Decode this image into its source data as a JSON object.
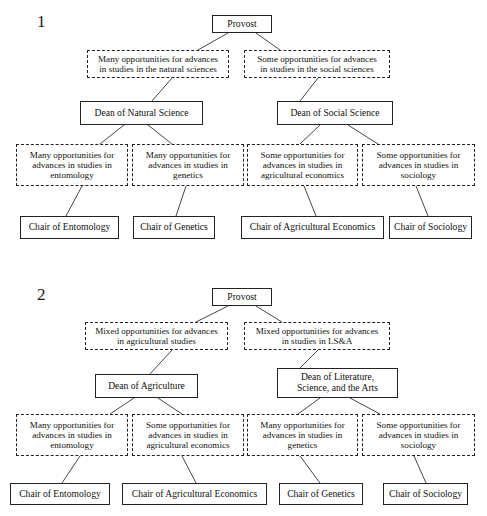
{
  "page": {
    "width": 487,
    "height": 516,
    "background": "#ffffff",
    "ink": "#1a1a1a"
  },
  "figures": [
    {
      "number": "1",
      "number_pos": {
        "x": 37,
        "y": 12
      },
      "nodes": [
        {
          "id": "f1-provost",
          "name": "node-provost",
          "style": "solid",
          "label": "Provost",
          "x": 212,
          "y": 15,
          "w": 60,
          "h": 18
        },
        {
          "id": "f1-opp-natural",
          "name": "node-opportunity-natural-sciences",
          "style": "dashed",
          "label": "Many opportunities for advances\nin studies in the natural sciences",
          "x": 87,
          "y": 50,
          "w": 142,
          "h": 28
        },
        {
          "id": "f1-opp-social",
          "name": "node-opportunity-social-sciences",
          "style": "dashed",
          "label": "Some opportunities for advances\nin studies in the social sciences",
          "x": 244,
          "y": 50,
          "w": 146,
          "h": 28
        },
        {
          "id": "f1-dean-natural",
          "name": "node-dean-natural-science",
          "style": "solid",
          "label": "Dean of Natural Science",
          "x": 80,
          "y": 101,
          "w": 123,
          "h": 24
        },
        {
          "id": "f1-dean-social",
          "name": "node-dean-social-science",
          "style": "solid",
          "label": "Dean of Social Science",
          "x": 277,
          "y": 101,
          "w": 116,
          "h": 24
        },
        {
          "id": "f1-opp-entomology",
          "name": "node-opportunity-entomology",
          "style": "dashed",
          "label": "Many opportunities for\nadvances in studies in\nentomology",
          "x": 16,
          "y": 144,
          "w": 112,
          "h": 42
        },
        {
          "id": "f1-opp-genetics",
          "name": "node-opportunity-genetics",
          "style": "dashed",
          "label": "Many opportunities for\nadvances in studies in\ngenetics",
          "x": 132,
          "y": 144,
          "w": 112,
          "h": 42
        },
        {
          "id": "f1-opp-agecon",
          "name": "node-opportunity-agricultural-economics",
          "style": "dashed",
          "label": "Some opportunities for\nadvances in studies in\nagricultural economics",
          "x": 247,
          "y": 144,
          "w": 111,
          "h": 42
        },
        {
          "id": "f1-opp-sociology",
          "name": "node-opportunity-sociology",
          "style": "dashed",
          "label": "Some opportunities for\nadvances in studies in\nsociology",
          "x": 362,
          "y": 144,
          "w": 113,
          "h": 42
        },
        {
          "id": "f1-chair-entomology",
          "name": "node-chair-entomology",
          "style": "solid",
          "label": "Chair of Entomology",
          "x": 20,
          "y": 216,
          "w": 99,
          "h": 23
        },
        {
          "id": "f1-chair-genetics",
          "name": "node-chair-genetics",
          "style": "solid",
          "label": "Chair of Genetics",
          "x": 133,
          "y": 216,
          "w": 82,
          "h": 23
        },
        {
          "id": "f1-chair-agecon",
          "name": "node-chair-agricultural-economics",
          "style": "solid",
          "label": "Chair of Agricultural Economics",
          "x": 241,
          "y": 216,
          "w": 143,
          "h": 23
        },
        {
          "id": "f1-chair-sociology",
          "name": "node-chair-sociology",
          "style": "solid",
          "label": "Chair of Sociology",
          "x": 389,
          "y": 216,
          "w": 83,
          "h": 23
        }
      ],
      "links": [
        {
          "x1": 228,
          "y1": 33,
          "x2": 198,
          "y2": 50
        },
        {
          "x1": 256,
          "y1": 33,
          "x2": 280,
          "y2": 50
        },
        {
          "x1": 172,
          "y1": 78,
          "x2": 152,
          "y2": 101
        },
        {
          "x1": 318,
          "y1": 78,
          "x2": 300,
          "y2": 101
        },
        {
          "x1": 124,
          "y1": 125,
          "x2": 100,
          "y2": 144
        },
        {
          "x1": 148,
          "y1": 125,
          "x2": 172,
          "y2": 144
        },
        {
          "x1": 320,
          "y1": 125,
          "x2": 300,
          "y2": 144
        },
        {
          "x1": 348,
          "y1": 125,
          "x2": 378,
          "y2": 144
        },
        {
          "x1": 82,
          "y1": 186,
          "x2": 66,
          "y2": 216
        },
        {
          "x1": 186,
          "y1": 186,
          "x2": 176,
          "y2": 216
        },
        {
          "x1": 304,
          "y1": 186,
          "x2": 316,
          "y2": 216
        },
        {
          "x1": 416,
          "y1": 186,
          "x2": 428,
          "y2": 216
        }
      ]
    },
    {
      "number": "2",
      "number_pos": {
        "x": 37,
        "y": 285
      },
      "nodes": [
        {
          "id": "f2-provost",
          "name": "node-provost",
          "style": "solid",
          "label": "Provost",
          "x": 212,
          "y": 288,
          "w": 60,
          "h": 18
        },
        {
          "id": "f2-opp-ag",
          "name": "node-opportunity-agricultural-studies",
          "style": "dashed",
          "label": "Mixed opportunities for advances\nin agricultural studies",
          "x": 85,
          "y": 322,
          "w": 143,
          "h": 28
        },
        {
          "id": "f2-opp-lsa",
          "name": "node-opportunity-lsa",
          "style": "dashed",
          "label": "Mixed opportunities for advances\nin studies in LS&A",
          "x": 244,
          "y": 322,
          "w": 146,
          "h": 28
        },
        {
          "id": "f2-dean-ag",
          "name": "node-dean-agriculture",
          "style": "solid",
          "label": "Dean of Agriculture",
          "x": 95,
          "y": 374,
          "w": 103,
          "h": 24
        },
        {
          "id": "f2-dean-lsa",
          "name": "node-dean-literature-science-arts",
          "style": "solid",
          "label": "Dean of Literature,\nScience, and the Arts",
          "x": 277,
          "y": 368,
          "w": 121,
          "h": 30
        },
        {
          "id": "f2-opp-entomology",
          "name": "node-opportunity-entomology",
          "style": "dashed",
          "label": "Many opportunities for\nadvances in studies in\nentomology",
          "x": 16,
          "y": 414,
          "w": 112,
          "h": 42
        },
        {
          "id": "f2-opp-agecon",
          "name": "node-opportunity-agricultural-economics",
          "style": "dashed",
          "label": "Some opportunities for\nadvances in studies in\nagricultural economics",
          "x": 132,
          "y": 414,
          "w": 112,
          "h": 42
        },
        {
          "id": "f2-opp-genetics",
          "name": "node-opportunity-genetics",
          "style": "dashed",
          "label": "Many opportunities for\nadvances in studies in\ngenetics",
          "x": 247,
          "y": 414,
          "w": 111,
          "h": 42
        },
        {
          "id": "f2-opp-sociology",
          "name": "node-opportunity-sociology",
          "style": "dashed",
          "label": "Some opportunities for\nadvances in studies in\nsociology",
          "x": 362,
          "y": 414,
          "w": 113,
          "h": 42
        },
        {
          "id": "f2-chair-entomology",
          "name": "node-chair-entomology",
          "style": "solid",
          "label": "Chair of Entomology",
          "x": 10,
          "y": 483,
          "w": 100,
          "h": 22
        },
        {
          "id": "f2-chair-agecon",
          "name": "node-chair-agricultural-economics",
          "style": "solid",
          "label": "Chair of Agricultural Economics",
          "x": 122,
          "y": 483,
          "w": 145,
          "h": 22
        },
        {
          "id": "f2-chair-genetics",
          "name": "node-chair-genetics",
          "style": "solid",
          "label": "Chair of Genetics",
          "x": 279,
          "y": 483,
          "w": 84,
          "h": 22
        },
        {
          "id": "f2-chair-sociology",
          "name": "node-chair-sociology",
          "style": "solid",
          "label": "Chair of Sociology",
          "x": 383,
          "y": 483,
          "w": 85,
          "h": 22
        }
      ],
      "links": [
        {
          "x1": 228,
          "y1": 306,
          "x2": 196,
          "y2": 322
        },
        {
          "x1": 256,
          "y1": 306,
          "x2": 282,
          "y2": 322
        },
        {
          "x1": 172,
          "y1": 350,
          "x2": 150,
          "y2": 374
        },
        {
          "x1": 318,
          "y1": 350,
          "x2": 300,
          "y2": 368
        },
        {
          "x1": 134,
          "y1": 398,
          "x2": 110,
          "y2": 414
        },
        {
          "x1": 158,
          "y1": 398,
          "x2": 182,
          "y2": 414
        },
        {
          "x1": 320,
          "y1": 398,
          "x2": 298,
          "y2": 414
        },
        {
          "x1": 350,
          "y1": 398,
          "x2": 380,
          "y2": 414
        },
        {
          "x1": 80,
          "y1": 456,
          "x2": 62,
          "y2": 483
        },
        {
          "x1": 182,
          "y1": 456,
          "x2": 196,
          "y2": 483
        },
        {
          "x1": 300,
          "y1": 456,
          "x2": 320,
          "y2": 483
        },
        {
          "x1": 414,
          "y1": 456,
          "x2": 426,
          "y2": 483
        }
      ]
    }
  ]
}
